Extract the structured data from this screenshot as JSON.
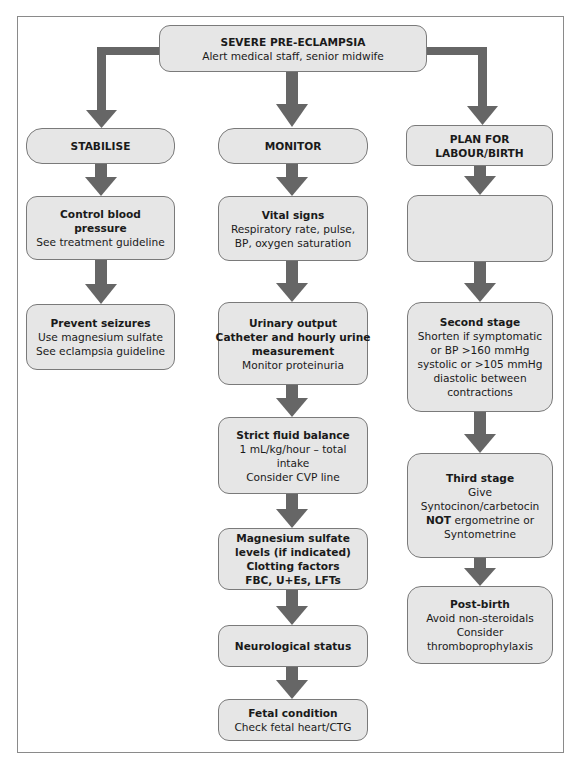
{
  "colors": {
    "box_fill": "#e6e6e6",
    "box_border": "#7a7a7a",
    "arrow": "#666666",
    "frame": "#8a8a8a"
  },
  "top": {
    "title": "SEVERE PRE-ECLAMPSIA",
    "subtitle": "Alert medical staff, senior midwife"
  },
  "columns": {
    "stabilise": {
      "header": "STABILISE",
      "steps": [
        {
          "title_lines": [
            "Control blood",
            "pressure"
          ],
          "lines": [
            "See treatment guideline"
          ]
        },
        {
          "title_lines": [
            "Prevent seizures"
          ],
          "lines": [
            "Use magnesium sulfate",
            "See eclampsia guideline"
          ]
        }
      ]
    },
    "monitor": {
      "header": "MONITOR",
      "steps": [
        {
          "title_lines": [
            "Vital signs"
          ],
          "lines": [
            "Respiratory rate, pulse,",
            "BP, oxygen saturation"
          ]
        },
        {
          "title_lines": [
            "Urinary output",
            "Catheter and hourly urine",
            "measurement"
          ],
          "lines": [
            "Monitor proteinuria"
          ]
        },
        {
          "title_lines": [
            "Strict fluid balance"
          ],
          "lines": [
            "1 mL/kg/hour – total",
            "intake",
            "Consider CVP line"
          ]
        },
        {
          "title_lines": [
            "Magnesium sulfate",
            "levels (if indicated)",
            "Clotting factors",
            "FBC, U+Es, LFTs"
          ],
          "lines": []
        },
        {
          "title_lines": [
            "Neurological status"
          ],
          "lines": []
        },
        {
          "title_lines": [
            "Fetal condition"
          ],
          "lines": [
            "Check fetal heart/CTG"
          ]
        }
      ]
    },
    "plan": {
      "header_lines": [
        "PLAN FOR",
        "LABOUR/BIRTH"
      ],
      "steps": [
        {
          "title_lines": [],
          "lines": []
        },
        {
          "title_lines": [
            "Second stage"
          ],
          "lines": [
            "Shorten if symptomatic",
            "or BP >160 mmHg",
            "systolic or >105 mmHg",
            "diastolic between",
            "contractions"
          ]
        },
        {
          "title_lines": [
            "Third stage"
          ],
          "lines": [
            "Give",
            "Syntocinon/carbetocin"
          ],
          "not_bold": "NOT",
          "not_rest": " ergometrine or",
          "last_line": "Syntometrine"
        },
        {
          "title_lines": [
            "Post-birth"
          ],
          "lines": [
            "Avoid non-steroidals",
            "Consider",
            "thromboprophylaxis"
          ]
        }
      ]
    }
  }
}
